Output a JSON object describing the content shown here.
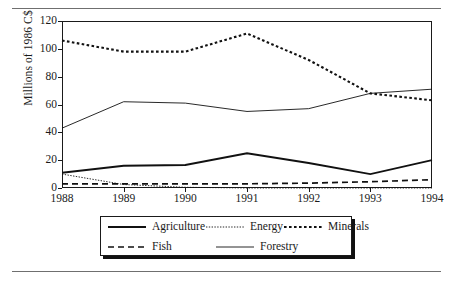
{
  "chart_data": {
    "type": "line",
    "title": "",
    "xlabel": "",
    "ylabel": "Millions of 1986 C$",
    "categories": [
      "1988",
      "1989",
      "1990",
      "1991",
      "1992",
      "1993",
      "1994"
    ],
    "x": [
      1988,
      1989,
      1990,
      1991,
      1992,
      1993,
      1994
    ],
    "xlim": [
      1988,
      1994
    ],
    "ylim": [
      0,
      120
    ],
    "yticks": [
      0,
      20,
      40,
      60,
      80,
      100,
      120
    ],
    "ytick_labels": [
      "0",
      "20",
      "40",
      "60",
      "80",
      "100",
      "120"
    ],
    "grid": false,
    "legend_position": "bottom",
    "series": [
      {
        "name": "Agriculture",
        "line_style": "solid-thick",
        "color": "#111111",
        "values": [
          11,
          16,
          16.5,
          25,
          18,
          10,
          20
        ]
      },
      {
        "name": "Energy",
        "line_style": "dotted-fine",
        "color": "#111111",
        "values": [
          10,
          2.5,
          0.5,
          0,
          0,
          0,
          0
        ]
      },
      {
        "name": "Minerals",
        "line_style": "dotted-thick",
        "color": "#111111",
        "values": [
          106,
          98,
          98,
          111,
          92,
          68,
          63
        ]
      },
      {
        "name": "Fish",
        "line_style": "dashed",
        "color": "#111111",
        "values": [
          3,
          3,
          3,
          3,
          3.5,
          4.5,
          6
        ]
      },
      {
        "name": "Forestry",
        "line_style": "solid-thin",
        "color": "#111111",
        "values": [
          43,
          62,
          61,
          55,
          57,
          68,
          71
        ]
      }
    ]
  },
  "legend": {
    "entries": [
      {
        "label": "Agriculture",
        "style": "solid-thick"
      },
      {
        "label": "Energy",
        "style": "dotted-fine"
      },
      {
        "label": "Minerals",
        "style": "dotted-thick"
      },
      {
        "label": "Fish",
        "style": "dashed"
      },
      {
        "label": "Forestry",
        "style": "solid-thin"
      }
    ]
  }
}
